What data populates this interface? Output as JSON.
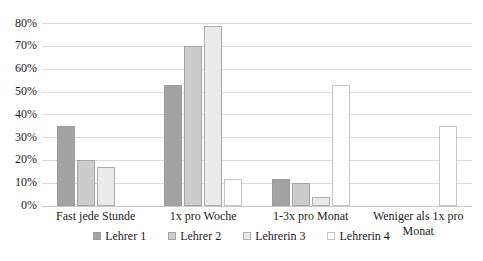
{
  "chart_data": {
    "type": "bar",
    "title": "",
    "xlabel": "",
    "ylabel": "",
    "categories": [
      "Fast jede Stunde",
      "1x pro Woche",
      "1-3x pro Monat",
      "Weniger als 1x pro Monat"
    ],
    "series": [
      {
        "name": "Lehrer 1",
        "values": [
          35,
          53,
          12,
          0
        ],
        "fill": "#a3a3a3",
        "border": "#9c9c9c"
      },
      {
        "name": "Lehrer 2",
        "values": [
          20,
          70,
          10,
          0
        ],
        "fill": "#cccccc",
        "border": "#a5a5a5"
      },
      {
        "name": "Lehrerin 3",
        "values": [
          17,
          79,
          4,
          0
        ],
        "fill": "#eaeaea",
        "border": "#aeaeae"
      },
      {
        "name": "Lehrerin 4",
        "values": [
          0,
          12,
          53,
          35
        ],
        "fill": "#ffffff",
        "border": "#c4c4c4"
      }
    ],
    "ylim": [
      0,
      80
    ],
    "ytick_step": 10,
    "ytick_labels": [
      "0%",
      "10%",
      "20%",
      "30%",
      "40%",
      "50%",
      "60%",
      "70%",
      "80%"
    ],
    "grid": true,
    "legend_position": "bottom",
    "colors": {
      "background": "#ffffff",
      "gridline": "#dcdcdc",
      "axis_line": "#c9c9c9",
      "text": "#1c1c1c"
    }
  }
}
